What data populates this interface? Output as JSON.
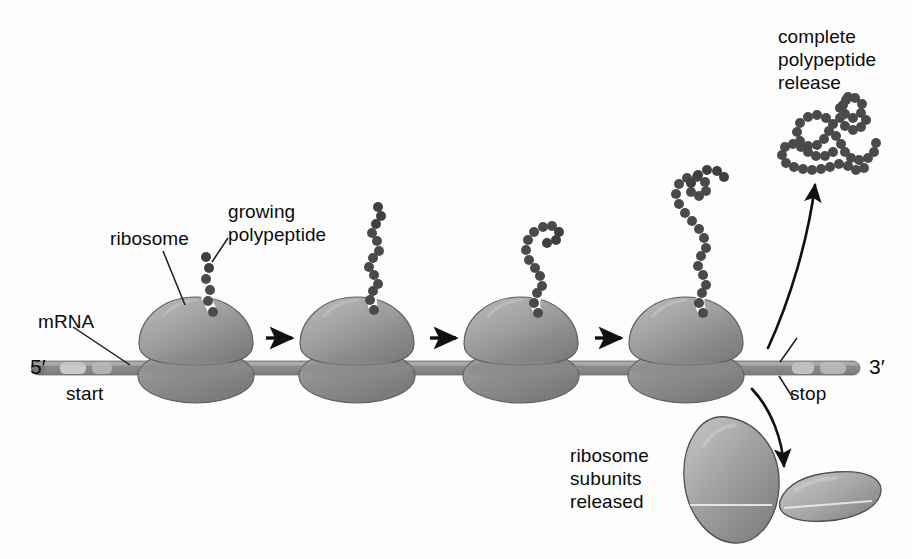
{
  "figure": {
    "background_color": "#fdfdfd",
    "ink_color": "#111111"
  },
  "labels": {
    "ribosome": "ribosome",
    "growing_polypeptide_line1": "growing",
    "growing_polypeptide_line2": "polypeptide",
    "mrna": "mRNA",
    "five_prime": "5′",
    "three_prime": "3′",
    "start": "start",
    "stop": "stop",
    "complete_release_line1": "complete",
    "complete_release_line2": "polypeptide",
    "complete_release_line3": "release",
    "subunits_released_line1": "ribosome",
    "subunits_released_line2": "subunits",
    "subunits_released_line3": "released"
  },
  "colors": {
    "mrna_strand": "#8d8d8d",
    "mrna_codon_light": "#cfcfcf",
    "ribosome_large": "#8f8f8f",
    "ribosome_large_light": "#b9b9b9",
    "ribosome_small": "#7f7f7f",
    "polypeptide_bead": "#4a4a4a",
    "arrow": "#111111",
    "leader_line": "#1a1a1a"
  },
  "stages": [
    {
      "id": "stage-1",
      "x": 196,
      "polypeptide_beads": 6,
      "description": "ribosome near start codon with short nascent chain"
    },
    {
      "id": "stage-2",
      "x": 357,
      "polypeptide_beads": 17,
      "description": "ribosome mid-mRNA with longer wavy chain"
    },
    {
      "id": "stage-3",
      "x": 521,
      "polypeptide_beads": 26,
      "description": "ribosome further along with looping chain"
    },
    {
      "id": "stage-4",
      "x": 686,
      "polypeptide_beads": 38,
      "description": "ribosome approaching stop codon with longest chain"
    }
  ],
  "arrows": {
    "elongation_arrow_count": 3,
    "elongation_arrow_xs": [
      280,
      444,
      609
    ],
    "elongation_arrow_y": 338,
    "release_arrow_up": "curved arrow to released polypeptide",
    "release_arrow_down": "curved arrow to released ribosome subunits"
  },
  "mrna": {
    "y": 368,
    "x_start": 30,
    "x_end": 860,
    "five_prime_cap": true,
    "start_codon_x": 70,
    "stop_codon_x": 800
  },
  "released": {
    "polypeptide": {
      "x": 855,
      "y": 115,
      "beads": 52,
      "shape": "folded globular chain"
    },
    "large_subunit": {
      "cx": 726,
      "cy": 485,
      "rx": 52,
      "ry": 68,
      "rotation": -28
    },
    "small_subunit": {
      "cx": 822,
      "cy": 500,
      "rx": 56,
      "ry": 22,
      "rotation": -12
    }
  }
}
